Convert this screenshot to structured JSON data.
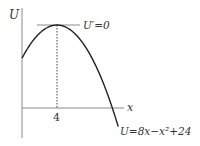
{
  "diagram": {
    "type": "function-graph",
    "axes": {
      "y_label": "U",
      "x_label": "x",
      "x_tick_label": "4"
    },
    "tangent_label": "U′=0",
    "curve_label": "U=8x−x²+24",
    "curve": {
      "function": "U = 8x - x^2 + 24",
      "vertex": {
        "x": 4,
        "U": 40
      },
      "y_intercept": 24
    },
    "colors": {
      "curve": "#222222",
      "axes": "#888888",
      "text": "#333333"
    }
  }
}
